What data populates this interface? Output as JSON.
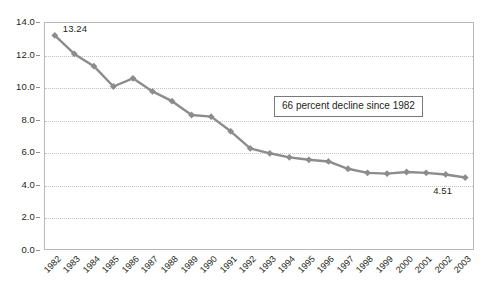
{
  "chart_data": {
    "type": "line",
    "title": "",
    "subtitle": "",
    "xlabel": "",
    "ylabel": "",
    "categories": [
      "1982",
      "1983",
      "1984",
      "1985",
      "1986",
      "1987",
      "1988",
      "1989",
      "1990",
      "1991",
      "1992",
      "1993",
      "1994",
      "1995",
      "1996",
      "1997",
      "1998",
      "1999",
      "2000",
      "2001",
      "2002",
      "2003"
    ],
    "values": [
      13.24,
      12.1,
      11.35,
      10.1,
      10.6,
      9.8,
      9.2,
      8.35,
      8.25,
      7.35,
      6.3,
      6.0,
      5.75,
      5.6,
      5.5,
      5.05,
      4.8,
      4.75,
      4.85,
      4.8,
      4.7,
      4.51
    ],
    "series": [
      {
        "name": "rate",
        "values": [
          13.24,
          12.1,
          11.35,
          10.1,
          10.6,
          9.8,
          9.2,
          8.35,
          8.25,
          7.35,
          6.3,
          6.0,
          5.75,
          5.6,
          5.5,
          5.05,
          4.8,
          4.75,
          4.85,
          4.8,
          4.7,
          4.51
        ]
      }
    ],
    "ylim": [
      0.0,
      14.0
    ],
    "ytick_step": 2.0,
    "ytick_labels": [
      "14.0",
      "12.0",
      "10.0",
      "8.0",
      "6.0",
      "4.0",
      "2.0",
      "0.0"
    ],
    "ytick_values": [
      14.0,
      12.0,
      10.0,
      8.0,
      6.0,
      4.0,
      2.0,
      0.0
    ],
    "grid": true,
    "grid_axis": "y",
    "legend": false,
    "legend_position": "none",
    "marker": "diamond",
    "line_color": "#8c8c8c",
    "marker_color": "#8c8c8c",
    "grid_color": "#c4c4c4",
    "axis_color": "#b9b9b9",
    "background_color": "#ffffff",
    "point_labels": [
      {
        "category": "1982",
        "value": 13.24,
        "text": "13.24",
        "position": "right"
      },
      {
        "category": "2003",
        "value": 4.51,
        "text": "4.51",
        "position": "below-left"
      }
    ],
    "annotations": [
      {
        "name": "decline-callout",
        "text": "66 percent decline since 1982",
        "boxed": true
      }
    ]
  },
  "annotation": {
    "text": "66 percent decline since 1982"
  },
  "labels": {
    "first_point": "13.24",
    "last_point": "4.51"
  }
}
